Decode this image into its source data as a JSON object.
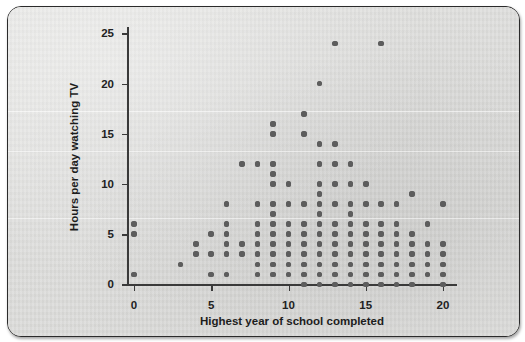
{
  "figure": {
    "background_color": "#dededc",
    "dot_color": "#5d5d5d",
    "axis_color": "#3a3a3a"
  },
  "chart_data": {
    "type": "scatter",
    "title": "",
    "xlabel": "Highest year of school completed",
    "ylabel": "Hours per day watching TV",
    "xlim": [
      -1,
      21
    ],
    "ylim": [
      -1,
      26
    ],
    "xticks": [
      0,
      5,
      10,
      15,
      20
    ],
    "yticks": [
      0,
      5,
      10,
      15,
      20,
      25
    ],
    "xticklabels": [
      "0",
      "5",
      "10",
      "15",
      "20"
    ],
    "yticklabels": [
      "0",
      "5",
      "10",
      "15",
      "20",
      "25"
    ],
    "grid": false,
    "legend": null,
    "columns": [
      {
        "x": 0,
        "y_values": [
          1,
          5,
          6
        ]
      },
      {
        "x": 3,
        "y_values": [
          2
        ]
      },
      {
        "x": 4,
        "y_values": [
          3,
          4
        ]
      },
      {
        "x": 5,
        "y_values": [
          1,
          3,
          5
        ]
      },
      {
        "x": 6,
        "y_values": [
          1,
          3,
          4,
          5,
          6,
          8
        ]
      },
      {
        "x": 7,
        "y_values": [
          3,
          4,
          12
        ]
      },
      {
        "x": 8,
        "y_values": [
          1,
          2,
          3,
          4,
          5,
          6,
          8,
          12
        ]
      },
      {
        "x": 9,
        "y_values": [
          1,
          2,
          3,
          4,
          5,
          6,
          7,
          8,
          10,
          11,
          12,
          15,
          16
        ]
      },
      {
        "x": 10,
        "y_values": [
          1,
          2,
          3,
          4,
          5,
          6,
          8,
          10
        ]
      },
      {
        "x": 11,
        "y_values": [
          0,
          1,
          2,
          3,
          4,
          5,
          6,
          8,
          15,
          17
        ]
      },
      {
        "x": 12,
        "y_values": [
          0,
          1,
          2,
          3,
          4,
          5,
          6,
          7,
          8,
          9,
          10,
          12,
          14,
          20
        ]
      },
      {
        "x": 13,
        "y_values": [
          0,
          1,
          2,
          3,
          4,
          5,
          6,
          8,
          10,
          12,
          14,
          24
        ]
      },
      {
        "x": 14,
        "y_values": [
          0,
          1,
          2,
          3,
          4,
          5,
          6,
          7,
          8,
          10,
          12
        ]
      },
      {
        "x": 15,
        "y_values": [
          0,
          1,
          2,
          3,
          4,
          5,
          6,
          8,
          10
        ]
      },
      {
        "x": 16,
        "y_values": [
          0,
          1,
          2,
          3,
          4,
          5,
          6,
          8,
          24
        ]
      },
      {
        "x": 17,
        "y_values": [
          0,
          1,
          2,
          3,
          4,
          5,
          6,
          8
        ]
      },
      {
        "x": 18,
        "y_values": [
          0,
          1,
          2,
          3,
          4,
          5,
          9
        ]
      },
      {
        "x": 19,
        "y_values": [
          1,
          2,
          3,
          4,
          6
        ]
      },
      {
        "x": 20,
        "y_values": [
          0,
          1,
          2,
          3,
          4,
          8
        ]
      }
    ]
  }
}
